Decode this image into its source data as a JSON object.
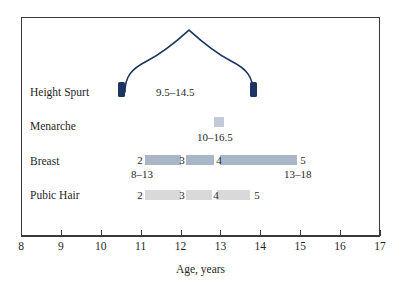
{
  "chart_data": {
    "type": "bar",
    "title": "",
    "xlabel": "Age, years",
    "ylabel": "",
    "xlim": [
      8,
      17
    ],
    "ylim": [
      0,
      4
    ],
    "grid": false,
    "legend": "none",
    "x_ticks": [
      8,
      9,
      10,
      11,
      12,
      13,
      14,
      15,
      16,
      17
    ],
    "x_tick_labels": [
      "8",
      "9",
      "10",
      "11",
      "12",
      "13",
      "14",
      "15",
      "16",
      "17"
    ],
    "rows": [
      {
        "label": "Height Spurt",
        "kind": "curve",
        "start_age": 10.5,
        "peak_age": 12.0,
        "end_age": 14.0,
        "range_text": "9.5–14.5",
        "range_label_age": 11.6,
        "color": "#1b3461"
      },
      {
        "label": "Menarche",
        "kind": "point",
        "age": 12.95,
        "range_text": "10–16.5",
        "color": "#c3cbd6"
      },
      {
        "label": "Breast",
        "kind": "stages",
        "bar_start_age": 11.1,
        "bar_end_age": 14.9,
        "color": "#a8b6c8",
        "stages": [
          {
            "number": "2",
            "age": 11.05
          },
          {
            "number": "3",
            "age": 12.0
          },
          {
            "number": "4",
            "age": 12.8
          },
          {
            "number": "5",
            "age": 15.0
          }
        ],
        "left_note": "8–13",
        "left_note_age": 11.0,
        "right_note": "13–18",
        "right_note_age": 14.6
      },
      {
        "label": "Pubic Hair",
        "kind": "stages",
        "bar_start_age": 11.1,
        "bar_end_age": 13.8,
        "color": "#d9d9d9",
        "stages": [
          {
            "number": "2",
            "age": 11.05
          },
          {
            "number": "3",
            "age": 12.0
          },
          {
            "number": "4",
            "age": 12.75
          },
          {
            "number": "5",
            "age": 13.9
          }
        ],
        "left_note": "",
        "right_note": ""
      }
    ]
  },
  "axis": {
    "title": "Age, years"
  },
  "colors": {
    "curve": "#1b3461",
    "marker": "#1b3461",
    "breast_bar": "#a8b6c8",
    "pubic_bar": "#d9d9d9",
    "menarche": "#c3cbd6",
    "frame": "#3a3a3a",
    "text": "#1f1f1f"
  }
}
